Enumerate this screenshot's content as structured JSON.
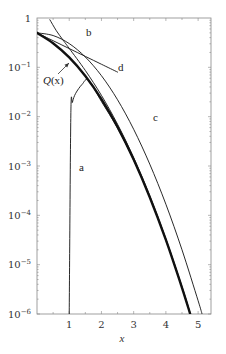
{
  "chart_data": {
    "type": "line",
    "title": "",
    "xlabel": "x",
    "ylabel": "",
    "xscale": "linear",
    "yscale": "log",
    "xlim": [
      0,
      5.4
    ],
    "ylim": [
      1e-06,
      1
    ],
    "grid": false,
    "legend": "none (inline curve labels)",
    "x_ticks": [
      1,
      2,
      3,
      4,
      5
    ],
    "x_tick_labels": [
      "1",
      "2",
      "3",
      "4",
      "5"
    ],
    "y_ticks": [
      1,
      0.1,
      0.01,
      0.001,
      0.0001,
      1e-05,
      1e-06
    ],
    "y_tick_labels": [
      {
        "base": "1",
        "exp": ""
      },
      {
        "base": "10",
        "exp": "−1"
      },
      {
        "base": "10",
        "exp": "−2"
      },
      {
        "base": "10",
        "exp": "−3"
      },
      {
        "base": "10",
        "exp": "−4"
      },
      {
        "base": "10",
        "exp": "−5"
      },
      {
        "base": "10",
        "exp": "−6"
      }
    ],
    "series": [
      {
        "name": "Q(x)",
        "label": "Q(x)",
        "style": "thick",
        "x": [
          0,
          0.5,
          1,
          1.5,
          2,
          2.5,
          3,
          3.5,
          4,
          4.5,
          4.75
        ],
        "values": [
          0.5,
          0.3085,
          0.1587,
          0.0668,
          0.02275,
          0.00621,
          0.00135,
          0.000233,
          3.17e-05,
          3.4e-06,
          1.02e-06
        ]
      },
      {
        "name": "a",
        "label": "a",
        "style": "thin",
        "x": [
          1.0,
          1.05,
          1.1,
          1.2,
          1.4,
          1.6,
          2,
          2.5,
          3,
          3.5,
          4,
          4.5,
          4.75
        ],
        "values": [
          1e-06,
          0.0108,
          0.0196,
          0.0297,
          0.0452,
          0.0549,
          0.0203,
          0.00583,
          0.00131,
          0.00023,
          3.15e-05,
          3.4e-06,
          1.02e-06
        ]
      },
      {
        "name": "b",
        "label": "b",
        "style": "thin",
        "x": [
          0.4,
          0.6,
          0.8,
          1,
          1.5,
          2,
          2.5,
          3,
          3.5,
          4,
          4.5,
          4.75
        ],
        "values": [
          0.92,
          0.553,
          0.363,
          0.242,
          0.0864,
          0.027,
          0.00701,
          0.00148,
          0.000249,
          3.35e-05,
          3.6e-06,
          1.07e-06
        ]
      },
      {
        "name": "c",
        "label": "c",
        "style": "thin",
        "x": [
          0,
          0.5,
          1,
          1.5,
          2,
          2.5,
          3,
          3.5,
          4,
          4.5,
          5,
          5.12
        ],
        "values": [
          0.5,
          0.441,
          0.303,
          0.162,
          0.0677,
          0.022,
          0.00555,
          0.00109,
          0.000168,
          2e-05,
          1.86e-06,
          1.01e-06
        ]
      },
      {
        "name": "d",
        "label": "d",
        "style": "thin",
        "x": [
          0,
          0.5,
          1,
          1.5,
          2,
          2.5
        ],
        "values": [
          0.5,
          0.3466,
          0.2403,
          0.1666,
          0.1155,
          0.0801
        ]
      }
    ],
    "annotations": [
      {
        "text": "a",
        "x": 1.25,
        "y": 0.0025
      },
      {
        "text": "b",
        "x": 1.55,
        "y": 0.78
      },
      {
        "text": "c",
        "x": 3.7,
        "y": 0.032
      },
      {
        "text": "d",
        "x": 2.8,
        "y": 0.17
      },
      {
        "text": "Q(x)",
        "x": 0.7,
        "y": 0.077,
        "arrow_to": {
          "x": 1.05,
          "y": 0.17
        }
      }
    ]
  },
  "labels": {
    "xlabel": "x",
    "a": "a",
    "b": "b",
    "c": "c",
    "d": "d",
    "q_prefix": "Q",
    "q_arg": "(x)"
  }
}
